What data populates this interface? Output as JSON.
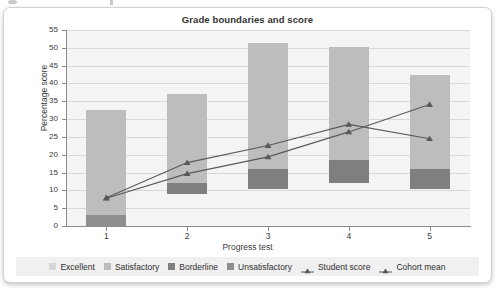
{
  "chart_data": {
    "type": "bar",
    "title": "Grade boundaries and score",
    "xlabel": "Progress test",
    "ylabel": "Percentage score",
    "ylim": [
      0,
      55
    ],
    "ytick_step": 5,
    "yticks": [
      0,
      5,
      10,
      15,
      20,
      25,
      30,
      35,
      40,
      45,
      50,
      55
    ],
    "categories": [
      "1",
      "2",
      "3",
      "4",
      "5"
    ],
    "grid": true,
    "legend_position": "bottom",
    "stacked": true,
    "bar_bands": [
      {
        "name": "Unsatisfactory",
        "color": "#8f8f8f",
        "ranges": [
          [
            0,
            3.2
          ],
          [
            9.0,
            9.0
          ],
          [
            10.5,
            10.5
          ],
          [
            12.0,
            12.0
          ],
          [
            10.5,
            10.5
          ]
        ]
      },
      {
        "name": "Borderline",
        "color": "#7f7f7f",
        "ranges": [
          [
            3.2,
            3.2
          ],
          [
            9.0,
            12.1
          ],
          [
            10.5,
            16.1
          ],
          [
            12.0,
            18.6
          ],
          [
            10.5,
            15.9
          ]
        ]
      },
      {
        "name": "Satisfactory",
        "color": "#bdbdbd",
        "ranges": [
          [
            3.2,
            32.5
          ],
          [
            12.1,
            37.0
          ],
          [
            16.1,
            51.3
          ],
          [
            18.6,
            50.1
          ],
          [
            15.9,
            42.4
          ]
        ]
      },
      {
        "name": "Excellent",
        "color": "#d6d6d6",
        "ranges": [
          [
            32.5,
            32.5
          ],
          [
            37.0,
            37.0
          ],
          [
            51.3,
            51.3
          ],
          [
            50.1,
            50.1
          ],
          [
            42.4,
            42.4
          ]
        ]
      }
    ],
    "series": [
      {
        "name": "Student score",
        "color": "#595959",
        "marker": "triangle",
        "values": [
          7.8,
          14.7,
          19.4,
          26.4,
          34.1
        ]
      },
      {
        "name": "Cohort mean",
        "color": "#595959",
        "marker": "triangle",
        "values": [
          7.9,
          17.8,
          22.6,
          28.5,
          24.5
        ]
      }
    ],
    "legend_entries": [
      {
        "label": "Excellent",
        "kind": "swatch",
        "color": "#d6d6d6"
      },
      {
        "label": "Satisfactory",
        "kind": "swatch",
        "color": "#bdbdbd"
      },
      {
        "label": "Borderline",
        "kind": "swatch",
        "color": "#7f7f7f"
      },
      {
        "label": "Unsatisfactory",
        "kind": "swatch",
        "color": "#8f8f8f"
      },
      {
        "label": "Student score",
        "kind": "line-marker",
        "color": "#595959"
      },
      {
        "label": "Cohort mean",
        "kind": "line-marker",
        "color": "#595959"
      }
    ]
  }
}
